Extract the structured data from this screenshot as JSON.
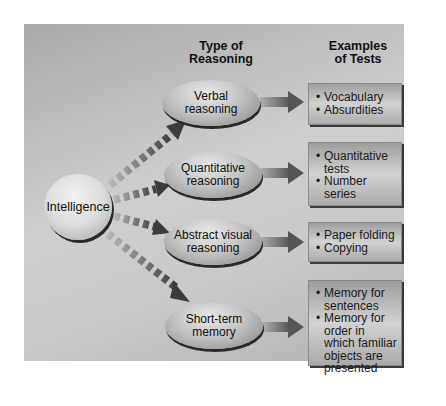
{
  "headers": {
    "type_of_reasoning": [
      "Type of",
      "Reasoning"
    ],
    "examples_of_tests": [
      "Examples",
      "of Tests"
    ]
  },
  "root": {
    "label": "Intelligence"
  },
  "branches": [
    {
      "reasoning": [
        "Verbal",
        "reasoning"
      ],
      "examples": [
        "Vocabulary",
        "Absurdities"
      ]
    },
    {
      "reasoning": [
        "Quantitative",
        "reasoning"
      ],
      "examples": [
        "Quantitative tests",
        "Number series"
      ]
    },
    {
      "reasoning": [
        "Abstract visual",
        "reasoning"
      ],
      "examples": [
        "Paper folding",
        "Copying"
      ]
    },
    {
      "reasoning": [
        "Short-term",
        "memory"
      ],
      "examples": [
        "Memory for sentences",
        "Memory for order in which familiar objects are presented"
      ]
    }
  ],
  "colors": {
    "panel": "#c4c4c4",
    "arrow_dark": "#4a4a4a",
    "arrow_light": "#9a9a9a"
  }
}
